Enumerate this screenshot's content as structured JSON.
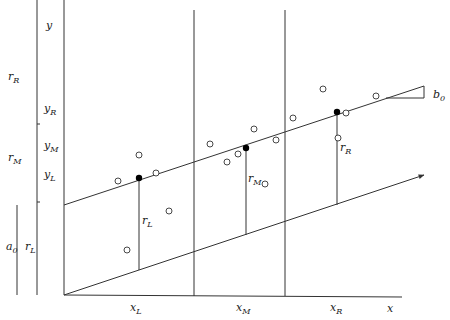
{
  "diagram": {
    "type": "three-group resistant line construction",
    "axis_labels": {
      "x": "x",
      "y": "y"
    },
    "group_labels": {
      "x": [
        {
          "base": "x",
          "sub": "L"
        },
        {
          "base": "x",
          "sub": "M"
        },
        {
          "base": "x",
          "sub": "R"
        }
      ],
      "y": [
        {
          "base": "y",
          "sub": "R"
        },
        {
          "base": "y",
          "sub": "M"
        },
        {
          "base": "y",
          "sub": "L"
        }
      ]
    },
    "residual_labels": [
      {
        "base": "r",
        "sub": "L"
      },
      {
        "base": "r",
        "sub": "M"
      },
      {
        "base": "r",
        "sub": "R"
      }
    ],
    "left_scale_labels": [
      {
        "base": "r",
        "sub": "R"
      },
      {
        "base": "r",
        "sub": "M"
      },
      {
        "base": "r",
        "sub": "L"
      }
    ],
    "intercept_label": {
      "base": "a",
      "sub": "0"
    },
    "slope_label": {
      "base": "b",
      "sub": "0"
    },
    "groups": [
      "left",
      "middle",
      "right"
    ],
    "summary_points": [
      {
        "group": "L",
        "style": "filled"
      },
      {
        "group": "M",
        "style": "filled"
      },
      {
        "group": "R",
        "style": "filled"
      }
    ],
    "observation_counts": {
      "left": 5,
      "middle": 6,
      "right": 5
    }
  }
}
